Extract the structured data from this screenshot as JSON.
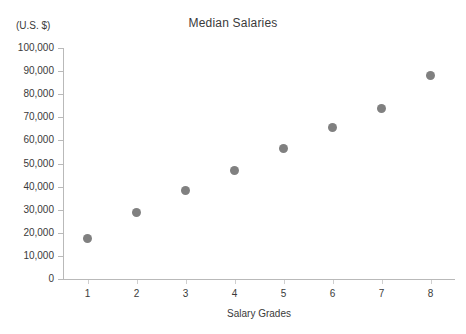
{
  "chart_data": {
    "type": "scatter",
    "title": "Median Salaries",
    "xlabel": "Salary Grades",
    "ylabel": "(U.S. $)",
    "unit_caption": "(U.S. $)",
    "categories": [
      "1",
      "2",
      "3",
      "4",
      "5",
      "6",
      "7",
      "8"
    ],
    "x": [
      1,
      2,
      3,
      4,
      5,
      6,
      7,
      8
    ],
    "values": [
      17500,
      29000,
      38500,
      47000,
      56700,
      65500,
      74000,
      88000
    ],
    "xlim": [
      0.5,
      8.5
    ],
    "ylim": [
      0,
      100000
    ],
    "ytick_values": [
      0,
      10000,
      20000,
      30000,
      40000,
      50000,
      60000,
      70000,
      80000,
      90000,
      100000
    ],
    "ytick_labels": [
      "0",
      "10,000",
      "20,000",
      "30,000",
      "40,000",
      "50,000",
      "60,000",
      "70,000",
      "80,000",
      "90,000",
      "100,000"
    ],
    "xtick_labels": [
      "1",
      "2",
      "3",
      "4",
      "5",
      "6",
      "7",
      "8"
    ],
    "grid": false,
    "legend": false,
    "marker_color": "#808080",
    "axis_color": "#b9b9b9",
    "text_color": "#3a3a3a",
    "background": "#ffffff"
  }
}
